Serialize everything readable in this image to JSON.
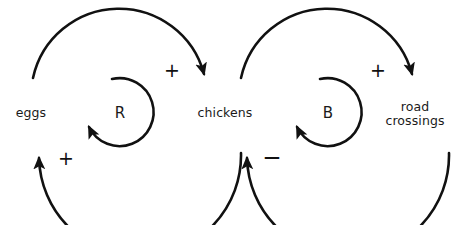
{
  "diagram": {
    "background_color": "#ffffff",
    "stroke_color": "#111111",
    "text_color": "#1a1a1a",
    "nodes": [
      {
        "id": "eggs",
        "label": "eggs",
        "x": 31,
        "y": 113
      },
      {
        "id": "chickens",
        "label": "chickens",
        "x": 225,
        "y": 113
      },
      {
        "id": "road-crossings",
        "label": "road\ncrossings",
        "x": 415,
        "y": 113
      }
    ],
    "loops": [
      {
        "id": "reinforcing",
        "letter": "R",
        "x": 120,
        "y": 113,
        "type": "reinforcing"
      },
      {
        "id": "balancing",
        "letter": "B",
        "x": 328,
        "y": 113,
        "type": "balancing"
      }
    ],
    "links": [
      {
        "id": "eggs-to-chickens",
        "from": "eggs",
        "to": "chickens",
        "polarity": "+",
        "polarity_x": 172,
        "polarity_y": 70
      },
      {
        "id": "chickens-to-eggs",
        "from": "chickens",
        "to": "eggs",
        "polarity": "+",
        "polarity_x": 66,
        "polarity_y": 158
      },
      {
        "id": "chickens-to-road-crossings",
        "from": "chickens",
        "to": "road-crossings",
        "polarity": "+",
        "polarity_x": 378,
        "polarity_y": 70
      },
      {
        "id": "road-crossings-to-chickens",
        "from": "road-crossings",
        "to": "chickens",
        "polarity": "−",
        "polarity_x": 272,
        "polarity_y": 157
      }
    ]
  }
}
